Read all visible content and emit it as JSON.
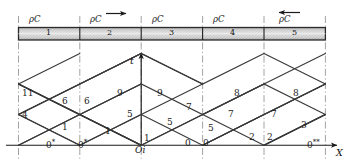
{
  "figure": {
    "type": "characteristics-xt-diagram",
    "axes": {
      "x_axis_label": "X",
      "t_axis_label": "t",
      "origin_label": "Oi"
    },
    "bar": {
      "material_label": "ρC",
      "segments": [
        {
          "id": 1,
          "number": "1",
          "label": "ρC",
          "arrow": "none"
        },
        {
          "id": 2,
          "number": "2",
          "label": "ρC",
          "arrow": "right"
        },
        {
          "id": 3,
          "number": "3",
          "label": "ρC",
          "arrow": "none"
        },
        {
          "id": 4,
          "number": "4",
          "label": "ρC",
          "arrow": "none"
        },
        {
          "id": 5,
          "number": "5",
          "label": "ρC",
          "arrow": "left"
        }
      ]
    },
    "region_numbers": [
      {
        "text": "11",
        "x": 22,
        "y": 89
      },
      {
        "text": "6",
        "x": 62,
        "y": 97
      },
      {
        "text": "6",
        "x": 84,
        "y": 97
      },
      {
        "text": "9",
        "x": 117,
        "y": 89
      },
      {
        "text": "9",
        "x": 157,
        "y": 89
      },
      {
        "text": "8",
        "x": 234,
        "y": 89
      },
      {
        "text": "8",
        "x": 293,
        "y": 89
      },
      {
        "text": "4",
        "x": 22,
        "y": 111
      },
      {
        "text": "5",
        "x": 127,
        "y": 110
      },
      {
        "text": "7",
        "x": 186,
        "y": 103
      },
      {
        "text": "7",
        "x": 228,
        "y": 110
      },
      {
        "text": "7",
        "x": 271,
        "y": 110
      },
      {
        "text": "1",
        "x": 62,
        "y": 123
      },
      {
        "text": "1",
        "x": 105,
        "y": 127
      },
      {
        "text": "5",
        "x": 167,
        "y": 118
      },
      {
        "text": "5",
        "x": 208,
        "y": 124
      },
      {
        "text": "3",
        "x": 301,
        "y": 121
      },
      {
        "text": "1",
        "x": 144,
        "y": 134
      },
      {
        "text": "2",
        "x": 249,
        "y": 133
      },
      {
        "text": "2",
        "x": 267,
        "y": 133
      },
      {
        "text": "0",
        "x": 185,
        "y": 139
      },
      {
        "text": "0",
        "x": 203,
        "y": 139
      }
    ],
    "boundary_numbers": [
      {
        "text": "0*",
        "x": 46,
        "y": 139
      },
      {
        "text": "0*",
        "x": 78,
        "y": 139
      },
      {
        "text": "0**",
        "x": 307,
        "y": 139
      }
    ]
  }
}
